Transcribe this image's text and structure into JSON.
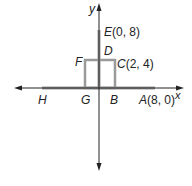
{
  "axes": {
    "x_label": "x",
    "y_label": "y"
  },
  "points": {
    "A": {
      "name": "A",
      "coords": "(8, 0)"
    },
    "B": {
      "name": "B",
      "coords": ""
    },
    "C": {
      "name": "C",
      "coords": "(2, 4)"
    },
    "D": {
      "name": "D",
      "coords": ""
    },
    "E": {
      "name": "E",
      "coords": "(0, 8)"
    },
    "F": {
      "name": "F",
      "coords": ""
    },
    "G": {
      "name": "G",
      "coords": ""
    },
    "H": {
      "name": "H",
      "coords": ""
    }
  },
  "colors": {
    "axis": "#222222",
    "segment": "#9a9a9a"
  }
}
